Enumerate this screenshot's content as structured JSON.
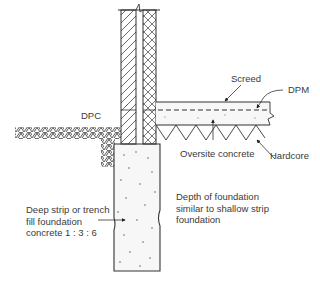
{
  "diagram": {
    "colors": {
      "line": "#333333",
      "concrete_fill": "#f7f7f7",
      "hatch": "#555555",
      "text": "#3a3a3a"
    },
    "labels": {
      "dpc": "DPC",
      "screed": "Screed",
      "dpm": "DPM",
      "oversite_concrete": "Oversite concrete",
      "hardcore": "Hardcore",
      "depth_note_line1": "Depth of foundation",
      "depth_note_line2": "similar to shallow strip",
      "depth_note_line3": "foundation",
      "foundation_line1": "Deep strip or trench",
      "foundation_line2": "fill foundation",
      "foundation_line3": "concrete 1 : 3 : 6"
    },
    "components": [
      "inner-leaf-wall",
      "cavity",
      "outer-leaf-wall",
      "floor-screed",
      "dpm",
      "oversite-concrete",
      "hardcore",
      "ground",
      "trench-fill-foundation"
    ],
    "mix_ratio": "1 : 3 : 6"
  }
}
